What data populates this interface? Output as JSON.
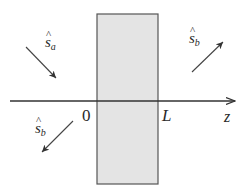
{
  "diagram": {
    "slab": {
      "fill": "#e4e4e4",
      "stroke": "#555555",
      "x": 97,
      "y": 14,
      "width": 61,
      "height": 170
    },
    "axis": {
      "label": "z",
      "y": 101,
      "x_start": 10,
      "x_end": 236
    },
    "labels": {
      "origin": "0",
      "thickness": "L",
      "axis": "z"
    },
    "vectors": [
      {
        "id": "s_a_incident",
        "symbol": "s",
        "subscript": "a",
        "hat": "^",
        "direction": "down-right"
      },
      {
        "id": "s_b_transmitted",
        "symbol": "s",
        "subscript": "b",
        "hat": "^",
        "direction": "up-right"
      },
      {
        "id": "s_b_reflected",
        "symbol": "s",
        "subscript": "b",
        "hat": "^",
        "direction": "down-left"
      }
    ],
    "colors": {
      "line": "#333333",
      "text": "#2a2a2a"
    }
  }
}
